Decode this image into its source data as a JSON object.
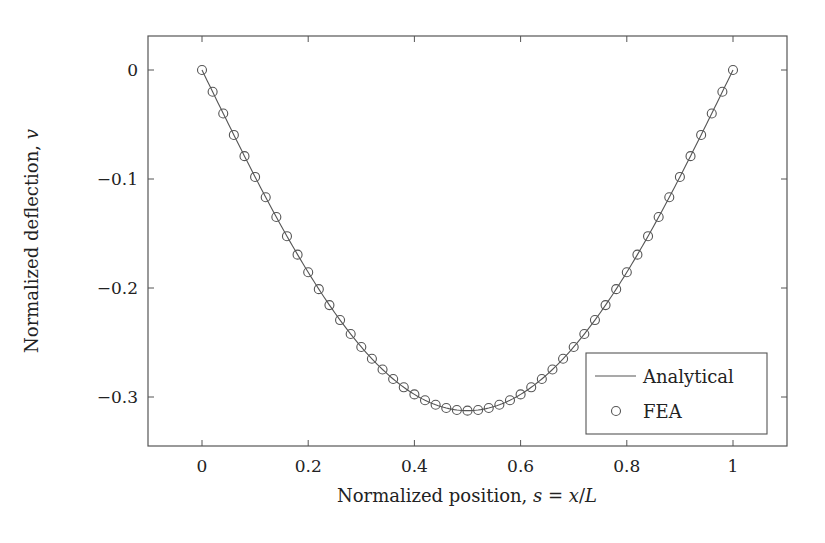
{
  "chart_data": {
    "type": "line",
    "title": "",
    "xlabel": "Normalized position, s = x/L",
    "ylabel": "Normalized deflection, v",
    "xlim": [
      -0.1,
      1.1
    ],
    "ylim": [
      -0.345,
      0.032
    ],
    "xticks": [
      0,
      0.2,
      0.4,
      0.6,
      0.8,
      1
    ],
    "xtick_labels": [
      "0",
      "0.2",
      "0.4",
      "0.6",
      "0.8",
      "1"
    ],
    "yticks": [
      0,
      -0.1,
      -0.2,
      -0.3
    ],
    "ytick_labels": [
      "0",
      "−0.1",
      "−0.2",
      "−0.3"
    ],
    "grid": false,
    "legend_position": "lower right",
    "series": [
      {
        "name": "Analytical",
        "style": "line",
        "color": "#555555",
        "x": [
          0,
          0.02,
          0.04,
          0.06,
          0.08,
          0.1,
          0.12,
          0.14,
          0.16,
          0.18,
          0.2,
          0.22,
          0.24,
          0.26,
          0.28,
          0.3,
          0.32,
          0.34,
          0.36,
          0.38,
          0.4,
          0.42,
          0.44,
          0.46,
          0.48,
          0.5,
          0.52,
          0.54,
          0.56,
          0.58,
          0.6,
          0.62,
          0.64,
          0.66,
          0.68,
          0.7,
          0.72,
          0.74,
          0.76,
          0.78,
          0.8,
          0.82,
          0.84,
          0.86,
          0.88,
          0.9,
          0.92,
          0.94,
          0.96,
          0.98,
          1
        ],
        "y": [
          0,
          -0.02,
          -0.0397,
          -0.0587,
          -0.077,
          -0.0981,
          -0.1154,
          -0.1318,
          -0.1472,
          -0.1615,
          -0.1824,
          -0.1947,
          -0.2058,
          -0.2158,
          -0.2247,
          -0.2541,
          -0.2604,
          -0.2695,
          -0.2764,
          -0.2814,
          -0.2976,
          -0.3028,
          -0.3074,
          -0.3106,
          -0.3121,
          -0.3125,
          -0.3121,
          -0.3106,
          -0.3074,
          -0.3028,
          -0.2976,
          -0.2814,
          -0.2764,
          -0.2695,
          -0.2604,
          -0.2541,
          -0.2247,
          -0.2158,
          -0.2058,
          -0.1947,
          -0.1824,
          -0.1615,
          -0.1472,
          -0.1318,
          -0.1154,
          -0.0981,
          -0.077,
          -0.0587,
          -0.0397,
          -0.02,
          0
        ]
      },
      {
        "name": "FEA",
        "style": "marker-circle-open",
        "color": "#555555",
        "x": [
          0,
          0.02,
          0.04,
          0.06,
          0.08,
          0.1,
          0.12,
          0.14,
          0.16,
          0.18,
          0.2,
          0.22,
          0.24,
          0.26,
          0.28,
          0.3,
          0.32,
          0.34,
          0.36,
          0.38,
          0.4,
          0.42,
          0.44,
          0.46,
          0.48,
          0.5,
          0.52,
          0.54,
          0.56,
          0.58,
          0.6,
          0.62,
          0.64,
          0.66,
          0.68,
          0.7,
          0.72,
          0.74,
          0.76,
          0.78,
          0.8,
          0.82,
          0.84,
          0.86,
          0.88,
          0.9,
          0.92,
          0.94,
          0.96,
          0.98,
          1
        ],
        "y": "same as Analytical (v = -(s - 2s^3 + s^4))"
      }
    ],
    "formula_hint": "v = -(s - 2 s^3 + s^4), min -0.3125 at s = 0.5"
  },
  "legend": {
    "items": [
      {
        "label": "Analytical",
        "symbol": "line"
      },
      {
        "label": "FEA",
        "symbol": "circle"
      }
    ]
  },
  "colors": {
    "line": "#555555",
    "axis": "#555555",
    "text": "#222222"
  }
}
